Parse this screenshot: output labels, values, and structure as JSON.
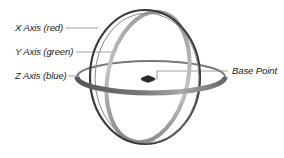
{
  "diagram": {
    "type": "rotate-gizmo",
    "labels": {
      "x_axis": "X Axis (red)",
      "y_axis": "Y Axis (green)",
      "z_axis": "Z Axis (blue)",
      "base_point": "Base Point"
    },
    "colors": {
      "x_ring": "#3a3a3a",
      "y_ring": "#b8b8b8",
      "z_ring": "#6a6a6a",
      "base_point": "#222222",
      "leader_line": "#9a9a9a",
      "background": "#ffffff"
    }
  }
}
